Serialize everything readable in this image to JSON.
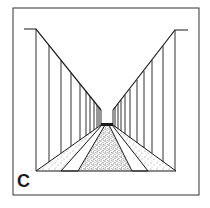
{
  "figure": {
    "label": "C",
    "colors": {
      "background": "#ffffff",
      "ink": "#1a1a1a",
      "frame": "#333333"
    }
  }
}
